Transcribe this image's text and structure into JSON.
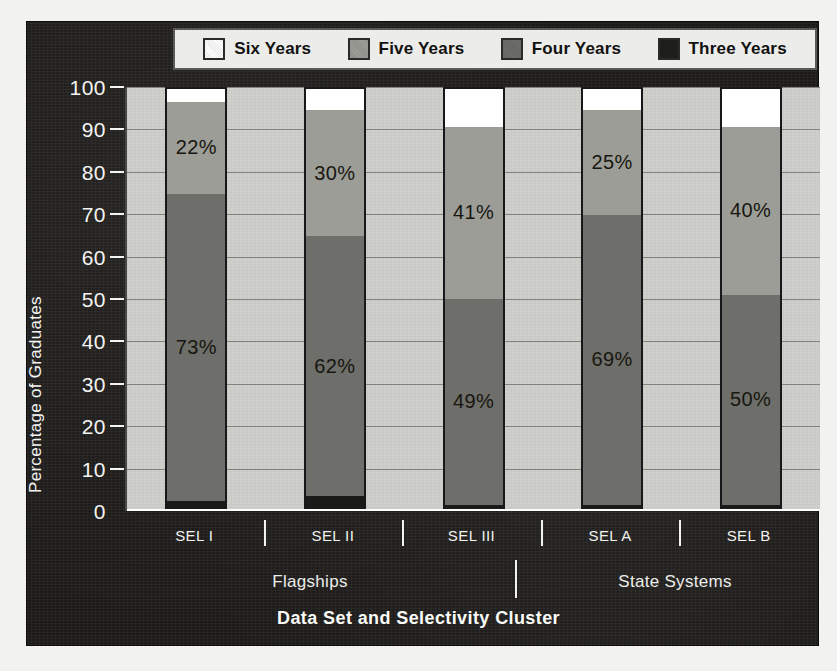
{
  "chart_data": {
    "type": "bar",
    "subtype": "stacked-bar-100",
    "title": "",
    "xlabel": "Data Set and Selectivity Cluster",
    "ylabel": "Percentage of Graduates",
    "ylim": [
      0,
      100
    ],
    "ytick_values": [
      0,
      10,
      20,
      30,
      40,
      50,
      60,
      70,
      80,
      90,
      100
    ],
    "ytick_labels": [
      "0",
      "10",
      "20",
      "30",
      "40",
      "50",
      "60",
      "70",
      "80",
      "90",
      "100"
    ],
    "grid": true,
    "legend_position": "top",
    "categories": [
      "SEL I",
      "SEL II",
      "SEL III",
      "SEL A",
      "SEL B"
    ],
    "groups": [
      {
        "label": "Flagships",
        "categories": [
          "SEL I",
          "SEL II",
          "SEL III"
        ]
      },
      {
        "label": "State Systems",
        "categories": [
          "SEL A",
          "SEL B"
        ]
      }
    ],
    "series": [
      {
        "name": "Three Years",
        "color": "#1a1a18",
        "values": [
          2,
          3,
          1,
          1,
          1
        ],
        "labels": [
          "",
          "",
          "",
          "",
          ""
        ]
      },
      {
        "name": "Four Years",
        "color": "#6e6e6a",
        "values": [
          73,
          62,
          49,
          69,
          50
        ],
        "labels": [
          "73%",
          "62%",
          "49%",
          "69%",
          "50%"
        ]
      },
      {
        "name": "Five Years",
        "color": "#9d9d98",
        "values": [
          22,
          30,
          41,
          25,
          40
        ],
        "labels": [
          "22%",
          "30%",
          "41%",
          "25%",
          "40%"
        ]
      },
      {
        "name": "Six Years",
        "color": "#ffffff",
        "values": [
          3,
          5,
          9,
          5,
          9
        ],
        "labels": [
          "",
          "",
          "",
          "",
          ""
        ]
      }
    ]
  },
  "legend": {
    "items": [
      {
        "label": "Six Years",
        "color": "#ffffff"
      },
      {
        "label": "Five Years",
        "color": "#9d9d98"
      },
      {
        "label": "Four Years",
        "color": "#6e6e6a"
      },
      {
        "label": "Three Years",
        "color": "#1f1f1d"
      }
    ]
  },
  "axes": {
    "y_title": "Percentage of Graduates",
    "x_title": "Data Set and Selectivity Cluster",
    "y_ticks": [
      "100",
      "90",
      "80",
      "70",
      "60",
      "50",
      "40",
      "30",
      "20",
      "10",
      "0"
    ],
    "x_ticks": [
      "SEL I",
      "SEL II",
      "SEL III",
      "SEL A",
      "SEL B"
    ],
    "group_labels": [
      "Flagships",
      "State Systems"
    ]
  },
  "colors": {
    "panel_background": "#1c1b19",
    "plot_background": "#cfcfcb",
    "gridline": "#76766f",
    "axis_text": "#f4f4f2",
    "bar_border": "#18181a",
    "legend_background": "#ececea",
    "page_background": "#f2f2f0"
  }
}
